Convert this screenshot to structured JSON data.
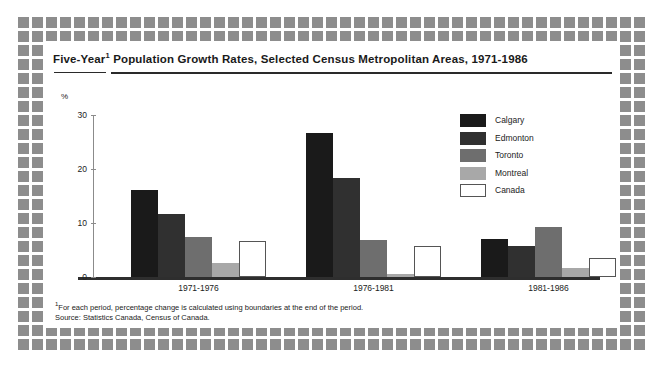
{
  "title": {
    "prefix": "Five-Year",
    "superscript": "1",
    "rest": " Population Growth Rates, Selected Census Metropolitan Areas, 1971-1986"
  },
  "footnote": {
    "marker": "1",
    "line1": "For each period, percentage change is calculated using boundaries at the end of the period.",
    "line2": "Source: Statistics Canada, Census of Canada."
  },
  "legend": {
    "items": [
      {
        "label": "Calgary",
        "color": "#1a1a1a"
      },
      {
        "label": "Edmonton",
        "color": "#303030"
      },
      {
        "label": "Toronto",
        "color": "#6e6e6e"
      },
      {
        "label": "Montreal",
        "color": "#a8a8a8"
      },
      {
        "label": "Canada",
        "color": "#ffffff"
      }
    ]
  },
  "chart_data": {
    "type": "bar",
    "xlabel": "",
    "ylabel": "%",
    "yunit": "%",
    "ylim": [
      0,
      30
    ],
    "yticks": [
      0,
      10,
      20,
      30
    ],
    "ytick_labels": [
      "0",
      "10",
      "20",
      "30"
    ],
    "grid": false,
    "legend_position": "upper-right",
    "categories": [
      "1971-1976",
      "1976-1981",
      "1981-1986"
    ],
    "series": [
      {
        "name": "Calgary",
        "color": "#1a1a1a",
        "values": [
          16.2,
          26.6,
          7.0
        ]
      },
      {
        "name": "Edmonton",
        "color": "#303030",
        "values": [
          11.7,
          18.3,
          5.7
        ]
      },
      {
        "name": "Toronto",
        "color": "#6e6e6e",
        "values": [
          7.4,
          6.8,
          9.3
        ]
      },
      {
        "name": "Montreal",
        "color": "#a8a8a8",
        "values": [
          2.6,
          0.6,
          1.7
        ]
      },
      {
        "name": "Canada",
        "color": "#ffffff",
        "values": [
          6.6,
          5.8,
          3.6
        ]
      }
    ]
  }
}
